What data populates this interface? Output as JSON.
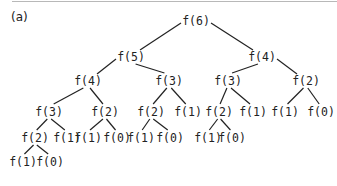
{
  "panel_label": "(a)",
  "nodes": [
    {
      "id": "n0",
      "label": "f(6)",
      "x": 196,
      "y": 21
    },
    {
      "id": "n1",
      "label": "f(5)",
      "x": 131,
      "y": 57
    },
    {
      "id": "n2",
      "label": "f(4)",
      "x": 262,
      "y": 57
    },
    {
      "id": "n3",
      "label": "f(4)",
      "x": 88,
      "y": 81
    },
    {
      "id": "n4",
      "label": "f(3)",
      "x": 169,
      "y": 81
    },
    {
      "id": "n5",
      "label": "f(3)",
      "x": 228,
      "y": 81
    },
    {
      "id": "n6",
      "label": "f(2)",
      "x": 306,
      "y": 81
    },
    {
      "id": "n7",
      "label": "f(3)",
      "x": 49,
      "y": 112
    },
    {
      "id": "n8",
      "label": "f(2)",
      "x": 105,
      "y": 112
    },
    {
      "id": "n9",
      "label": "f(2)",
      "x": 151,
      "y": 112
    },
    {
      "id": "n10",
      "label": "f(1)",
      "x": 188,
      "y": 112
    },
    {
      "id": "n11",
      "label": "f(2)",
      "x": 219,
      "y": 112
    },
    {
      "id": "n12",
      "label": "f(1)",
      "x": 253,
      "y": 112
    },
    {
      "id": "n13",
      "label": "f(1)",
      "x": 285,
      "y": 112
    },
    {
      "id": "n14",
      "label": "f(0)",
      "x": 321,
      "y": 112
    },
    {
      "id": "n15",
      "label": "f(2)",
      "x": 35,
      "y": 138
    },
    {
      "id": "n16",
      "label": "f(1)",
      "x": 67,
      "y": 138
    },
    {
      "id": "n17",
      "label": "f(1)",
      "x": 88,
      "y": 138
    },
    {
      "id": "n18",
      "label": "f(0)",
      "x": 117,
      "y": 138
    },
    {
      "id": "n19",
      "label": "f(1)",
      "x": 141,
      "y": 138
    },
    {
      "id": "n20",
      "label": "f(0)",
      "x": 170,
      "y": 138
    },
    {
      "id": "n21",
      "label": "f(1)",
      "x": 208,
      "y": 138
    },
    {
      "id": "n22",
      "label": "f(0)",
      "x": 232,
      "y": 138
    },
    {
      "id": "n23",
      "label": "f(1)",
      "x": 23,
      "y": 162
    },
    {
      "id": "n24",
      "label": "f(0)",
      "x": 50,
      "y": 162
    }
  ],
  "edges": [
    [
      "n0",
      "n1"
    ],
    [
      "n0",
      "n2"
    ],
    [
      "n1",
      "n3"
    ],
    [
      "n1",
      "n4"
    ],
    [
      "n2",
      "n5"
    ],
    [
      "n2",
      "n6"
    ],
    [
      "n3",
      "n7"
    ],
    [
      "n3",
      "n8"
    ],
    [
      "n4",
      "n9"
    ],
    [
      "n4",
      "n10"
    ],
    [
      "n5",
      "n11"
    ],
    [
      "n5",
      "n12"
    ],
    [
      "n6",
      "n13"
    ],
    [
      "n6",
      "n14"
    ],
    [
      "n7",
      "n15"
    ],
    [
      "n7",
      "n16"
    ],
    [
      "n8",
      "n17"
    ],
    [
      "n8",
      "n18"
    ],
    [
      "n9",
      "n19"
    ],
    [
      "n9",
      "n20"
    ],
    [
      "n11",
      "n21"
    ],
    [
      "n11",
      "n22"
    ],
    [
      "n15",
      "n23"
    ],
    [
      "n15",
      "n24"
    ]
  ]
}
